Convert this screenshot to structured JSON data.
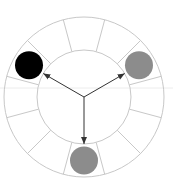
{
  "diagram": {
    "center": [
      84,
      97
    ],
    "outer_radius": 80,
    "inner_radius": 47,
    "segment_count": 12,
    "ring_stroke": "#c8c8c8",
    "arrow_color": "#333333",
    "horizon_line_color": "#e8e8e8",
    "nodes": [
      {
        "name": "black-node",
        "angle_deg": 150,
        "color": "#000000"
      },
      {
        "name": "gray-node-right",
        "angle_deg": 30,
        "color": "#8c8c8c"
      },
      {
        "name": "gray-node-bottom",
        "angle_deg": 270,
        "color": "#8c8c8c"
      }
    ],
    "node_radius": 14
  }
}
